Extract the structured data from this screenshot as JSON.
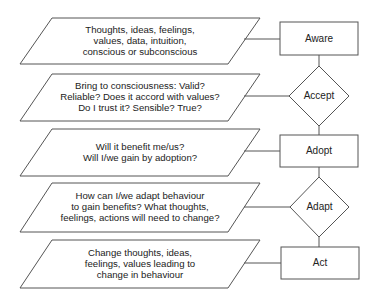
{
  "diagram": {
    "type": "flowchart",
    "stroke_color": "#555555",
    "inputs": [
      {
        "id": "p1",
        "text": "Thoughts, ideas, feelings,\nvalues, data, intuition,\nconscious or subconscious"
      },
      {
        "id": "p2",
        "text": "Bring to consciousness: Valid?\nReliable? Does it accord with values?\nDo I trust it? Sensible? True?"
      },
      {
        "id": "p3",
        "text": "Will it benefit me/us?\nWill I/we gain by adoption?"
      },
      {
        "id": "p4",
        "text": "How can I/we adapt behaviour\nto gain benefits? What thoughts,\nfeelings, actions will need to change?"
      },
      {
        "id": "p5",
        "text": "Change thoughts, ideas,\nfeelings, values leading to\nchange in behaviour"
      }
    ],
    "nodes": [
      {
        "id": "aware",
        "shape": "rectangle",
        "label": "Aware"
      },
      {
        "id": "accept",
        "shape": "diamond",
        "label": "Accept"
      },
      {
        "id": "adopt",
        "shape": "rectangle",
        "label": "Adopt"
      },
      {
        "id": "adapt",
        "shape": "diamond",
        "label": "Adapt"
      },
      {
        "id": "act",
        "shape": "rectangle",
        "label": "Act"
      }
    ],
    "edges": [
      {
        "from": "p1",
        "to": "aware"
      },
      {
        "from": "p2",
        "to": "accept"
      },
      {
        "from": "p3",
        "to": "adopt"
      },
      {
        "from": "p4",
        "to": "adapt"
      },
      {
        "from": "p5",
        "to": "act"
      },
      {
        "from": "aware",
        "to": "accept"
      },
      {
        "from": "accept",
        "to": "adopt"
      },
      {
        "from": "adopt",
        "to": "adapt"
      },
      {
        "from": "adapt",
        "to": "act"
      }
    ]
  }
}
